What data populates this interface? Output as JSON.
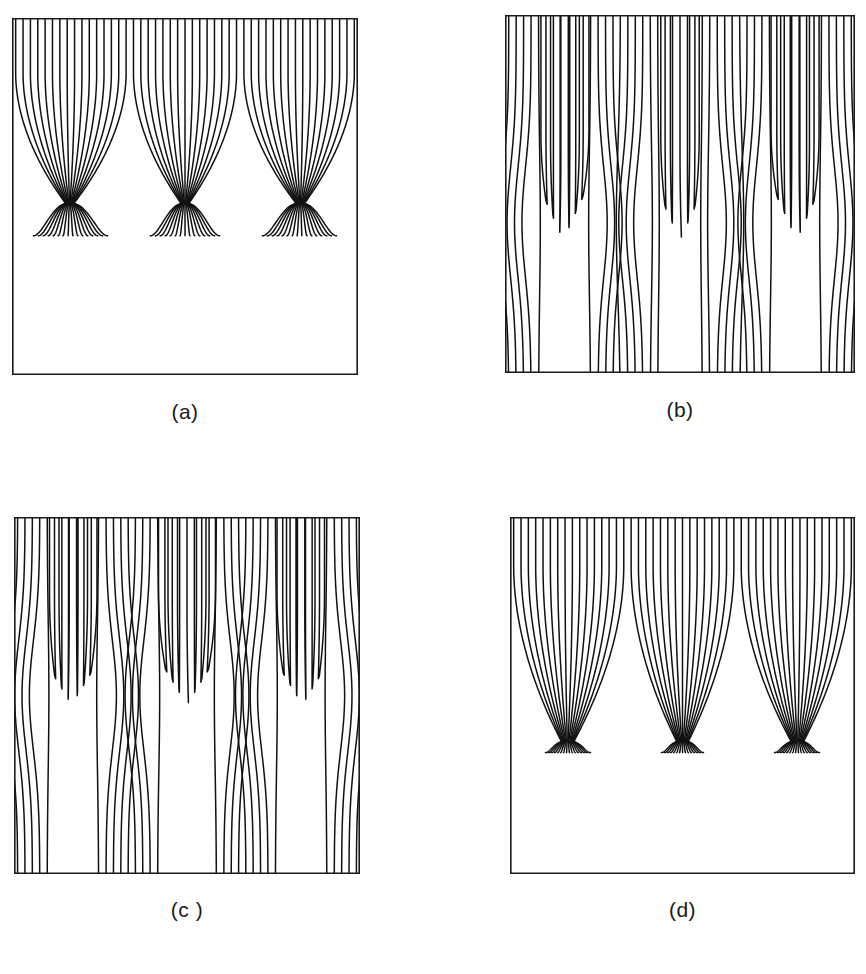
{
  "figure": {
    "width": 866,
    "height": 974,
    "background": "#ffffff",
    "line_color": "#111111",
    "frame_color": "#1b1b1b",
    "caption_color": "#1a1a1a"
  },
  "panels": [
    {
      "id": "panel-a",
      "caption": "(a)",
      "frame": {
        "x": 12,
        "y": 18,
        "w": 346,
        "h": 357
      },
      "caption_box": {
        "x": 12,
        "y": 400,
        "w": 346
      },
      "n_lines": 47,
      "n_cells": 3,
      "pattern": "cusp-focus",
      "top_y": 0.0,
      "bottom_y": 1.0,
      "focus_depth": 0.52,
      "focus_spread": 0.012,
      "tail_depth": 0.61,
      "tail_spread": 0.1,
      "straight_fraction": 0.3,
      "edge_open": true
    },
    {
      "id": "panel-b",
      "caption": "(b)",
      "frame": {
        "x": 505,
        "y": 15,
        "w": 350,
        "h": 358
      },
      "caption_box": {
        "x": 505,
        "y": 398,
        "w": 350
      },
      "n_lines": 47,
      "n_cells": 3,
      "pattern": "shallow-dip",
      "top_y": 0.0,
      "bottom_y": 1.0,
      "dip_depth": 0.62,
      "dip_width": 0.14,
      "lobe_depth": 0.58,
      "lobe_width": 0.26,
      "straight_fraction": 0.62,
      "edge_open": true
    },
    {
      "id": "panel-c",
      "caption": "(c )",
      "frame": {
        "x": 14,
        "y": 517,
        "w": 346,
        "h": 357
      },
      "caption_box": {
        "x": 14,
        "y": 898,
        "w": 346
      },
      "n_lines": 47,
      "n_cells": 3,
      "pattern": "deep-dip",
      "top_y": 0.0,
      "bottom_y": 1.0,
      "dip_depth": 0.52,
      "dip_width": 0.16,
      "lobe_depth": 0.5,
      "lobe_width": 0.3,
      "straight_fraction": 0.48,
      "edge_open": true
    },
    {
      "id": "panel-d",
      "caption": "(d)",
      "frame": {
        "x": 510,
        "y": 517,
        "w": 345,
        "h": 357
      },
      "caption_box": {
        "x": 510,
        "y": 898,
        "w": 345
      },
      "n_lines": 47,
      "n_cells": 3,
      "pattern": "funnel-focus",
      "top_y": 0.0,
      "bottom_y": 1.0,
      "focus_depth": 0.63,
      "focus_spread": 0.018,
      "tail_depth": 0.66,
      "tail_spread": 0.05,
      "straight_fraction": 0.22,
      "edge_open": true
    }
  ],
  "chart_data": {
    "type": "line",
    "title": "",
    "xlabel": "",
    "ylabel": "",
    "panel_count": 4,
    "panel_labels": [
      "(a)",
      "(b)",
      "(c )",
      "(d)"
    ],
    "grid": false,
    "legend": "none",
    "axis_ticks": "none",
    "xlim": [
      0,
      1
    ],
    "ylim": [
      0,
      1
    ],
    "series": [
      {
        "name": "(a)",
        "n_streamlines": 47,
        "periods": 3,
        "focus_y_fraction": 0.52,
        "tail_y_fraction": 0.61,
        "lines_reach_bottom": false,
        "note": "Streamlines collapse to three sharp cusp foci at about 52% depth, then splay into nested U tails ending near 61% depth; lower half of the frame is empty."
      },
      {
        "name": "(b)",
        "n_streamlines": 47,
        "periods": 3,
        "dip_y_fraction": 0.62,
        "lobe_y_fraction": 0.58,
        "lines_reach_bottom": true,
        "note": "Nearly straight vertical streamlines that run the full height, interrupted by three narrow U turns and three wide inverted lobes near 60% depth."
      },
      {
        "name": "(c )",
        "n_streamlines": 47,
        "periods": 3,
        "dip_y_fraction": 0.52,
        "lobe_y_fraction": 0.5,
        "lines_reach_bottom": true,
        "note": "Like (b) but the dips are deeper and narrower, forming small nested cusps near 52% depth while the remaining lines continue to the bottom edge."
      },
      {
        "name": "(d)",
        "n_streamlines": 47,
        "periods": 3,
        "focus_y_fraction": 0.63,
        "tail_y_fraction": 0.66,
        "lines_reach_bottom": false,
        "note": "Broad scalloped envelope funnelling all streamlines into three tight foci near 63% depth; lower third of the frame is empty."
      }
    ]
  }
}
